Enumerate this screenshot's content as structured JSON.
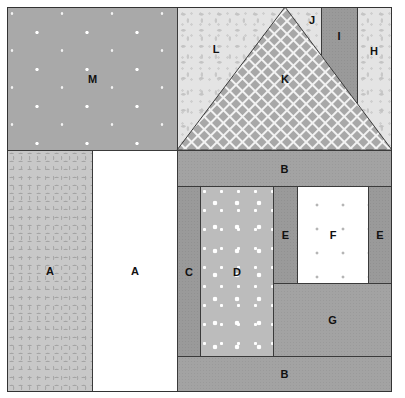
{
  "diagram": {
    "pieces": {
      "M": {
        "label": "M",
        "fabric": "gray with white stars"
      },
      "L": {
        "label": "L",
        "fabric": "light vine print"
      },
      "K": {
        "label": "K",
        "fabric": "gray lattice"
      },
      "J": {
        "label": "J",
        "fabric": "light vine print"
      },
      "I": {
        "label": "I",
        "fabric": "medium gray"
      },
      "H": {
        "label": "H",
        "fabric": "light vine print"
      },
      "A_left": {
        "label": "A",
        "fabric": "gray vine print"
      },
      "A_right": {
        "label": "A",
        "fabric": "white"
      },
      "B_top": {
        "label": "B",
        "fabric": "mottled gray"
      },
      "B_bottom": {
        "label": "B",
        "fabric": "mottled gray"
      },
      "C": {
        "label": "C",
        "fabric": "mottled dark gray"
      },
      "D": {
        "label": "D",
        "fabric": "gray with white dots"
      },
      "E_left": {
        "label": "E",
        "fabric": "mottled dark gray"
      },
      "E_right": {
        "label": "E",
        "fabric": "mottled dark gray"
      },
      "F": {
        "label": "F",
        "fabric": "white with gray stars"
      },
      "G": {
        "label": "G",
        "fabric": "mottled gray"
      }
    },
    "colors": {
      "outline": "#3a3a3a",
      "label": "#111111",
      "lattice_fill": "#a8a8a8",
      "lattice_line": "#f2f2f2"
    }
  }
}
